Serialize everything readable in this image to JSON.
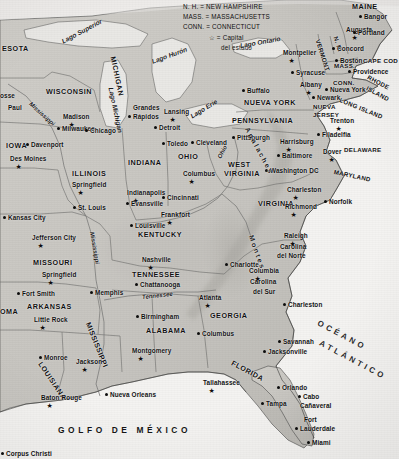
{
  "map": {
    "title": "Mapa del este de los Estados Unidos",
    "language": "es",
    "colors": {
      "land": "#c9c7c2",
      "land_shade": "#b4b2ad",
      "water": "#e9e8e5",
      "ocean": "#f4f3f1",
      "border": "#6a6a68",
      "coast": "#3a3a38",
      "text": "#111111"
    }
  },
  "legend": {
    "rows": [
      "N. H. = NEW HAMPSHIRE",
      "MASS. = MASSACHUSETTS",
      "CONN. = CONNECTICUT"
    ],
    "capital_symbol": "☆",
    "capital_line1": "= Capital",
    "capital_line2": "del estado"
  },
  "states": [
    {
      "name": "ESOTA",
      "x": 2,
      "y": 44,
      "rot": 0,
      "size": "norm"
    },
    {
      "name": "WISCONSIN",
      "x": 46,
      "y": 87,
      "rot": 0,
      "size": "norm"
    },
    {
      "name": "MICHIGAN",
      "x": 113,
      "y": 52,
      "rot": 78,
      "size": "norm"
    },
    {
      "name": "IOWA",
      "x": 6,
      "y": 141,
      "rot": 0,
      "size": "norm"
    },
    {
      "name": "ILLINOIS",
      "x": 72,
      "y": 169,
      "rot": 0,
      "size": "norm"
    },
    {
      "name": "INDIANA",
      "x": 128,
      "y": 158,
      "rot": 0,
      "size": "norm"
    },
    {
      "name": "OHIO",
      "x": 178,
      "y": 152,
      "rot": 0,
      "size": "norm"
    },
    {
      "name": "MISSOURI",
      "x": 33,
      "y": 258,
      "rot": 0,
      "size": "norm"
    },
    {
      "name": "ARKANSAS",
      "x": 27,
      "y": 302,
      "rot": 0,
      "size": "norm"
    },
    {
      "name": "OMA",
      "x": 0,
      "y": 307,
      "rot": 0,
      "size": "norm"
    },
    {
      "name": "KENTUCKY",
      "x": 138,
      "y": 230,
      "rot": 0,
      "size": "norm"
    },
    {
      "name": "TENNESSEE",
      "x": 132,
      "y": 270,
      "rot": 0,
      "size": "norm"
    },
    {
      "name": "ALABAMA",
      "x": 146,
      "y": 326,
      "rot": 0,
      "size": "norm"
    },
    {
      "name": "MISSISSIPPI",
      "x": 88,
      "y": 318,
      "rot": 68,
      "size": "norm"
    },
    {
      "name": "LOUISIANA",
      "x": 40,
      "y": 358,
      "rot": 56,
      "size": "norm"
    },
    {
      "name": "GEORGIA",
      "x": 210,
      "y": 311,
      "rot": 0,
      "size": "norm"
    },
    {
      "name": "FLORIDA",
      "x": 232,
      "y": 358,
      "rot": 28,
      "size": "norm"
    },
    {
      "name": "WEST",
      "x": 228,
      "y": 160,
      "rot": 0,
      "size": "norm"
    },
    {
      "name": "VIRGINIA",
      "x": 224,
      "y": 169,
      "rot": 0,
      "size": "norm"
    },
    {
      "name": "VIRGINIA",
      "x": 258,
      "y": 199,
      "rot": 0,
      "size": "norm"
    },
    {
      "name": "PENNSYLVANIA",
      "x": 232,
      "y": 116,
      "rot": 0,
      "size": "norm"
    },
    {
      "name": "NUEVA YORK",
      "x": 244,
      "y": 98,
      "rot": 0,
      "size": "norm"
    },
    {
      "name": "MARYLAND",
      "x": 334,
      "y": 168,
      "rot": 12,
      "size": "sm"
    },
    {
      "name": "DELAWARE",
      "x": 344,
      "y": 146,
      "rot": 0,
      "size": "sm"
    },
    {
      "name": "NUEVA",
      "x": 313,
      "y": 103,
      "rot": 0,
      "size": "sm"
    },
    {
      "name": "JERSEY",
      "x": 313,
      "y": 111,
      "rot": 0,
      "size": "sm"
    },
    {
      "name": "MAINE",
      "x": 352,
      "y": 2,
      "rot": 0,
      "size": "norm"
    },
    {
      "name": "VERMONT",
      "x": 318,
      "y": 36,
      "rot": 72,
      "size": "sm"
    },
    {
      "name": "N. H.",
      "x": 336,
      "y": 33,
      "rot": 72,
      "size": "sm"
    },
    {
      "name": "MASS.",
      "x": 334,
      "y": 62,
      "rot": 0,
      "size": "sm"
    },
    {
      "name": "CONN.",
      "x": 333,
      "y": 79,
      "rot": 0,
      "size": "sm"
    },
    {
      "name": "RHODE",
      "x": 368,
      "y": 73,
      "rot": 28,
      "size": "sm"
    },
    {
      "name": "ISLAND",
      "x": 367,
      "y": 84,
      "rot": 28,
      "size": "sm"
    },
    {
      "name": "CAPE COD",
      "x": 363,
      "y": 57,
      "rot": 0,
      "size": "sm"
    },
    {
      "name": "LONG ISLAND",
      "x": 340,
      "y": 96,
      "rot": 22,
      "size": "sm"
    },
    {
      "name": "Carolina",
      "x": 280,
      "y": 243,
      "rot": 0,
      "size": "cap"
    },
    {
      "name": "del Norte",
      "x": 277,
      "y": 252,
      "rot": 0,
      "size": "cap"
    },
    {
      "name": "Carolina",
      "x": 250,
      "y": 278,
      "rot": 0,
      "size": "cap"
    },
    {
      "name": "del Sur",
      "x": 253,
      "y": 288,
      "rot": 0,
      "size": "cap"
    }
  ],
  "cities": [
    {
      "name": "Paul",
      "x": 8,
      "y": 104,
      "dx": 0,
      "dy": 0,
      "cap": false,
      "dot": false,
      "anchor": "left"
    },
    {
      "name": "osse",
      "x": 0,
      "y": 92,
      "dx": 0,
      "dy": 0,
      "cap": false,
      "dot": false,
      "anchor": "left"
    },
    {
      "name": "Madison",
      "x": 63,
      "y": 113,
      "cap": true,
      "anchor": "left"
    },
    {
      "name": "Milwaukee",
      "x": 62,
      "y": 125,
      "cap": false,
      "dot": true,
      "anchor": "left"
    },
    {
      "name": "Chicago",
      "x": 90,
      "y": 127,
      "cap": false,
      "dot": true,
      "anchor": "left"
    },
    {
      "name": "Davenport",
      "x": 31,
      "y": 141,
      "cap": false,
      "dot": true,
      "anchor": "left"
    },
    {
      "name": "Des Moines",
      "x": 10,
      "y": 155,
      "cap": true,
      "anchor": "left"
    },
    {
      "name": "Springfield",
      "x": 72,
      "y": 181,
      "cap": true,
      "anchor": "left"
    },
    {
      "name": "St. Louis",
      "x": 78,
      "y": 204,
      "cap": false,
      "dot": true,
      "anchor": "left"
    },
    {
      "name": "Kansas City",
      "x": 8,
      "y": 214,
      "cap": false,
      "dot": true,
      "anchor": "left"
    },
    {
      "name": "Jefferson City",
      "x": 32,
      "y": 234,
      "cap": true,
      "anchor": "left"
    },
    {
      "name": "Springfield",
      "x": 42,
      "y": 271,
      "cap": true,
      "anchor": "left"
    },
    {
      "name": "Fort Smith",
      "x": 22,
      "y": 290,
      "cap": false,
      "dot": true,
      "anchor": "left"
    },
    {
      "name": "Little Rock",
      "x": 34,
      "y": 316,
      "cap": true,
      "anchor": "left"
    },
    {
      "name": "Memphis",
      "x": 95,
      "y": 289,
      "cap": false,
      "dot": true,
      "anchor": "left"
    },
    {
      "name": "Monroe",
      "x": 44,
      "y": 354,
      "cap": false,
      "dot": true,
      "anchor": "left"
    },
    {
      "name": "Jackson",
      "x": 76,
      "y": 358,
      "cap": true,
      "anchor": "left"
    },
    {
      "name": "Baton Rouge",
      "x": 41,
      "y": 394,
      "cap": true,
      "anchor": "left"
    },
    {
      "name": "Nueva Orleans",
      "x": 110,
      "y": 391,
      "cap": false,
      "dot": true,
      "anchor": "left"
    },
    {
      "name": "Corpus Christi",
      "x": 6,
      "y": 450,
      "cap": false,
      "dot": true,
      "anchor": "left"
    },
    {
      "name": "Grandes",
      "x": 133,
      "y": 104,
      "cap": false,
      "dot": false,
      "anchor": "left"
    },
    {
      "name": "Rápidos",
      "x": 133,
      "y": 113,
      "cap": false,
      "dot": true,
      "anchor": "left"
    },
    {
      "name": "Lansing",
      "x": 164,
      "y": 108,
      "cap": true,
      "anchor": "left"
    },
    {
      "name": "Detroit",
      "x": 159,
      "y": 124,
      "cap": false,
      "dot": true,
      "anchor": "left"
    },
    {
      "name": "Toledo",
      "x": 167,
      "y": 140,
      "cap": false,
      "dot": true,
      "anchor": "left"
    },
    {
      "name": "Cleveland",
      "x": 196,
      "y": 139,
      "cap": false,
      "dot": true,
      "anchor": "left"
    },
    {
      "name": "Columbus",
      "x": 183,
      "y": 170,
      "cap": true,
      "anchor": "left"
    },
    {
      "name": "Indianapolis",
      "x": 127,
      "y": 189,
      "cap": true,
      "anchor": "left"
    },
    {
      "name": "Cincinnati",
      "x": 167,
      "y": 194,
      "cap": false,
      "dot": true,
      "anchor": "left"
    },
    {
      "name": "Evansville",
      "x": 131,
      "y": 200,
      "cap": false,
      "dot": true,
      "anchor": "left"
    },
    {
      "name": "Frankfort",
      "x": 161,
      "y": 211,
      "cap": true,
      "anchor": "left"
    },
    {
      "name": "Louisville",
      "x": 135,
      "y": 222,
      "cap": false,
      "dot": true,
      "anchor": "left"
    },
    {
      "name": "Nashville",
      "x": 142,
      "y": 256,
      "cap": true,
      "anchor": "left"
    },
    {
      "name": "Chattanooga",
      "x": 140,
      "y": 281,
      "cap": false,
      "dot": true,
      "anchor": "left"
    },
    {
      "name": "Atlanta",
      "x": 199,
      "y": 294,
      "cap": true,
      "anchor": "left"
    },
    {
      "name": "Birmingham",
      "x": 141,
      "y": 313,
      "cap": false,
      "dot": true,
      "anchor": "left"
    },
    {
      "name": "Columbus",
      "x": 202,
      "y": 330,
      "cap": false,
      "dot": true,
      "anchor": "left"
    },
    {
      "name": "Montgomery",
      "x": 132,
      "y": 347,
      "cap": true,
      "anchor": "left"
    },
    {
      "name": "Tallahassee",
      "x": 203,
      "y": 379,
      "cap": true,
      "anchor": "left"
    },
    {
      "name": "Jacksonville",
      "x": 268,
      "y": 348,
      "cap": false,
      "dot": true,
      "anchor": "left"
    },
    {
      "name": "Orlando",
      "x": 282,
      "y": 384,
      "cap": false,
      "dot": true,
      "anchor": "left"
    },
    {
      "name": "Tampa",
      "x": 266,
      "y": 400,
      "cap": false,
      "dot": true,
      "anchor": "left"
    },
    {
      "name": "Cabo",
      "x": 303,
      "y": 393,
      "cap": false,
      "dot": true,
      "anchor": "left"
    },
    {
      "name": "Cañaveral",
      "x": 300,
      "y": 402,
      "cap": false,
      "dot": false,
      "anchor": "left"
    },
    {
      "name": "Fort",
      "x": 304,
      "y": 416,
      "cap": false,
      "dot": false,
      "anchor": "left"
    },
    {
      "name": "Lauderdale",
      "x": 300,
      "y": 425,
      "cap": false,
      "dot": true,
      "anchor": "left"
    },
    {
      "name": "Miami",
      "x": 312,
      "y": 439,
      "cap": false,
      "dot": true,
      "anchor": "left"
    },
    {
      "name": "Savannah",
      "x": 283,
      "y": 338,
      "cap": false,
      "dot": true,
      "anchor": "left"
    },
    {
      "name": "Charleston",
      "x": 288,
      "y": 301,
      "cap": false,
      "dot": true,
      "anchor": "left"
    },
    {
      "name": "Columbia",
      "x": 249,
      "y": 267,
      "cap": true,
      "anchor": "left"
    },
    {
      "name": "Charlotte",
      "x": 230,
      "y": 261,
      "cap": false,
      "dot": true,
      "anchor": "left"
    },
    {
      "name": "Raleigh",
      "x": 284,
      "y": 232,
      "cap": true,
      "anchor": "left"
    },
    {
      "name": "Richmond",
      "x": 285,
      "y": 203,
      "cap": true,
      "anchor": "left"
    },
    {
      "name": "Norfolk",
      "x": 329,
      "y": 198,
      "cap": false,
      "dot": true,
      "anchor": "left"
    },
    {
      "name": "Charleston",
      "x": 287,
      "y": 186,
      "cap": true,
      "anchor": "left"
    },
    {
      "name": "Washington DC",
      "x": 270,
      "y": 167,
      "cap": false,
      "dot": true,
      "anchor": "left"
    },
    {
      "name": "Baltimore",
      "x": 282,
      "y": 152,
      "cap": false,
      "dot": true,
      "anchor": "left"
    },
    {
      "name": "Dover",
      "x": 323,
      "y": 148,
      "cap": true,
      "anchor": "left"
    },
    {
      "name": "Harrisburg",
      "x": 280,
      "y": 138,
      "cap": true,
      "anchor": "left"
    },
    {
      "name": "Filadelfia",
      "x": 322,
      "y": 131,
      "cap": false,
      "dot": true,
      "anchor": "left"
    },
    {
      "name": "Trenton",
      "x": 330,
      "y": 117,
      "cap": true,
      "anchor": "left"
    },
    {
      "name": "Pittsburgh",
      "x": 237,
      "y": 134,
      "cap": false,
      "dot": true,
      "anchor": "left"
    },
    {
      "name": "Newark",
      "x": 317,
      "y": 94,
      "cap": false,
      "dot": true,
      "anchor": "left"
    },
    {
      "name": "Nueva York",
      "x": 330,
      "y": 86,
      "cap": false,
      "dot": true,
      "anchor": "left"
    },
    {
      "name": "Buffalo",
      "x": 247,
      "y": 87,
      "cap": false,
      "dot": true,
      "anchor": "left"
    },
    {
      "name": "Syracuse",
      "x": 296,
      "y": 69,
      "cap": false,
      "dot": true,
      "anchor": "left"
    },
    {
      "name": "Albany",
      "x": 300,
      "y": 81,
      "cap": true,
      "anchor": "left"
    },
    {
      "name": "Montpelier",
      "x": 283,
      "y": 49,
      "cap": true,
      "anchor": "left"
    },
    {
      "name": "Concord",
      "x": 337,
      "y": 45,
      "cap": false,
      "dot": true,
      "anchor": "left"
    },
    {
      "name": "Boston",
      "x": 340,
      "y": 57,
      "cap": false,
      "dot": true,
      "anchor": "left"
    },
    {
      "name": "Providence",
      "x": 353,
      "y": 68,
      "cap": false,
      "dot": true,
      "anchor": "left"
    },
    {
      "name": "Augusta",
      "x": 346,
      "y": 26,
      "cap": true,
      "anchor": "left"
    },
    {
      "name": "Bangor",
      "x": 364,
      "y": 13,
      "cap": false,
      "dot": true,
      "anchor": "left"
    },
    {
      "name": "Portland",
      "x": 358,
      "y": 29,
      "cap": false,
      "dot": true,
      "anchor": "left"
    }
  ],
  "water_labels": [
    {
      "name": "Lago Superior",
      "x": 62,
      "y": 38,
      "rot": -28
    },
    {
      "name": "Lago Michigan",
      "x": 111,
      "y": 84,
      "rot": 78
    },
    {
      "name": "Lago Hurón",
      "x": 152,
      "y": 58,
      "rot": -20
    },
    {
      "name": "Lago Erie",
      "x": 191,
      "y": 113,
      "rot": -32
    },
    {
      "name": "Lago Ontario",
      "x": 240,
      "y": 42,
      "rot": -10
    }
  ],
  "rivers": [
    {
      "name": "Mississippi",
      "x": 30,
      "y": 100,
      "rot": 42
    },
    {
      "name": "Mississippi",
      "x": 92,
      "y": 229,
      "rot": 80
    },
    {
      "name": "Tennessee",
      "x": 142,
      "y": 294,
      "rot": -6
    },
    {
      "name": "Ohio",
      "x": 219,
      "y": 155,
      "rot": -62
    }
  ],
  "regions": [
    {
      "name": "Apalaches",
      "x": 247,
      "y": 124,
      "rot": 62
    },
    {
      "name": "Montes",
      "x": 251,
      "y": 232,
      "rot": 70
    }
  ],
  "oceans": [
    {
      "name": "OCÉANO",
      "x": 318,
      "y": 318,
      "rot": 28
    },
    {
      "name": "ATLÁNTICO",
      "x": 320,
      "y": 338,
      "rot": 28
    }
  ],
  "gulf": {
    "name": "GOLFO DE MÉXICO",
    "x": 58,
    "y": 425
  }
}
